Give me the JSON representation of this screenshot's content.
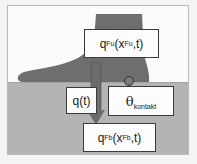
{
  "diagram": {
    "title": "",
    "colors": {
      "background": "#fbfbfb",
      "ground": "#b4b4b4",
      "foot": "#6e6e6e",
      "arrow": "#6c6c6c",
      "box_fill": "#fdfdfd",
      "box_border": "#3a3a3a",
      "sensor": "#7a7a7a"
    },
    "labels": {
      "heat_flux_foot": {
        "base": "q",
        "sub": "Fu",
        "open": "(x",
        "arg_sub": "Fu",
        "close": ",t)"
      },
      "heat_flux_floor": {
        "base": "q",
        "sub": "Fb",
        "open": "(x",
        "arg_sub": "Fb",
        "close": ",t)"
      },
      "heat_flux_time": "q(t)",
      "contact_temperature": {
        "symbol": "θ",
        "sub": "kontakt"
      }
    },
    "elements": [
      {
        "id": "foot",
        "type": "shape",
        "description": "gray silhouette of a foot and lower leg standing on floor"
      },
      {
        "id": "floor",
        "type": "region",
        "description": "gray floor layer"
      },
      {
        "id": "arrow",
        "type": "arrow",
        "direction": "down",
        "from": "heat_flux_foot",
        "to": "heat_flux_floor"
      },
      {
        "id": "sensor",
        "type": "circle",
        "description": "contact point sensor at sole"
      }
    ]
  }
}
